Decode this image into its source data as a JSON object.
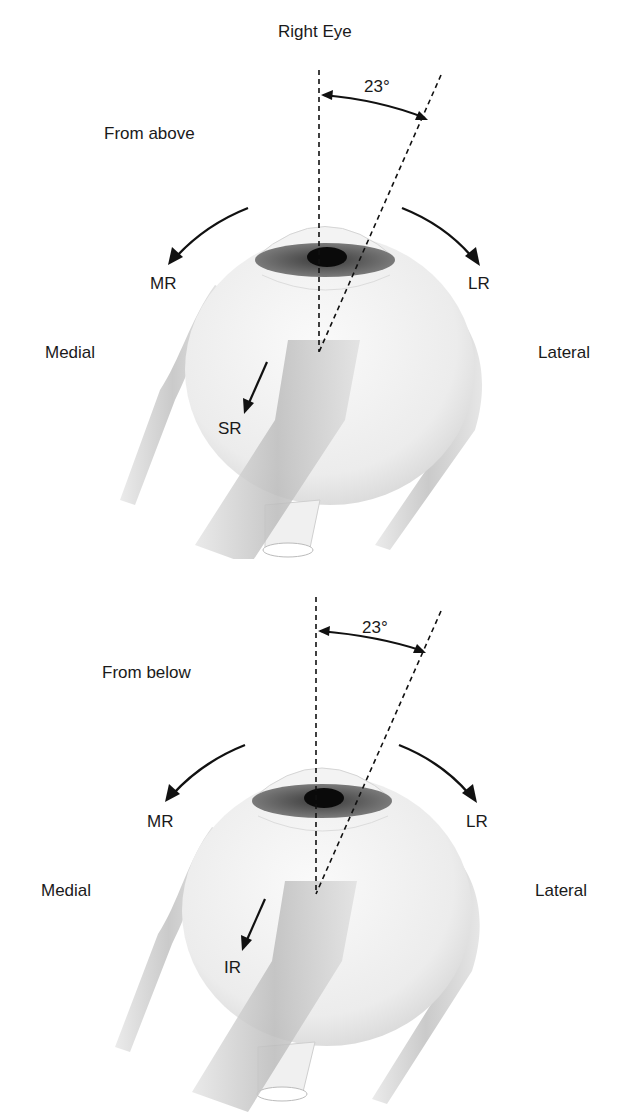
{
  "title": "Right Eye",
  "panels": [
    {
      "view": "From above",
      "angle": "23°",
      "left_muscle": "MR",
      "right_muscle": "LR",
      "left_side": "Medial",
      "right_side": "Lateral",
      "center_muscle": "SR"
    },
    {
      "view": "From below",
      "angle": "23°",
      "left_muscle": "MR",
      "right_muscle": "LR",
      "left_side": "Medial",
      "right_side": "Lateral",
      "center_muscle": "IR"
    }
  ],
  "colors": {
    "line": "#111111",
    "globe": "#eeeeee",
    "muscle": "#c8c8c8",
    "iris": "#6a6a6a",
    "pupil": "#0a0a0a"
  }
}
